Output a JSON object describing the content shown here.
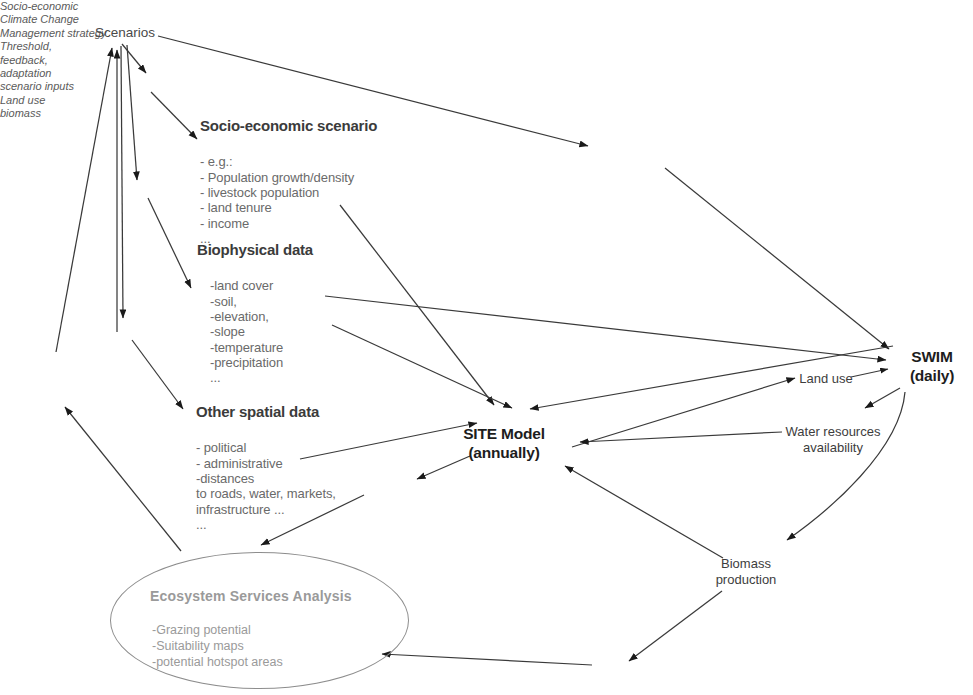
{
  "diagram": {
    "background_color": "#ffffff",
    "line_color": "#3a3a3a",
    "text_color": "#4c4c4c",
    "faded_text_color": "#9a9a9a"
  },
  "nodes": {
    "scenarios": {
      "label": "Scenarios"
    },
    "socio_economic": {
      "title": "Socio-economic scenario",
      "items": "- e.g.:\n- Population growth/density\n- livestock population\n- land tenure\n- income\n..."
    },
    "biophysical": {
      "title": "Biophysical data",
      "items": "-land cover\n-soil,\n-elevation,\n-slope\n-temperature\n-precipitation\n..."
    },
    "other_spatial": {
      "title": "Other spatial data",
      "items": "- political\n- administrative\n-distances\nto roads, water, markets,\ninfrastructure ...\n..."
    },
    "site_model": {
      "label": "SITE Model\n(annually)"
    },
    "swim": {
      "label": "SWIM\n(daily)"
    },
    "land_use_right": {
      "label": "Land use"
    },
    "water_resources": {
      "label": "Water resources\navailability"
    },
    "biomass_production": {
      "label": "Biomass\nproduction"
    },
    "ecosystem": {
      "title": "Ecosystem Services Analysis",
      "items": "-Grazing potential\n-Suitability maps\n-potential hotspot areas"
    }
  },
  "edge_labels": {
    "socio_economic": "Socio-economic",
    "climate_change": "Climate Change",
    "management_strategy": "Management strategy",
    "threshold_feedback": "Threshold,\nfeedback,\nadaptation",
    "scenario_inputs": "scenario inputs",
    "land_use_center": "Land use",
    "biomass": "biomass"
  },
  "caption": {
    "text": ""
  }
}
